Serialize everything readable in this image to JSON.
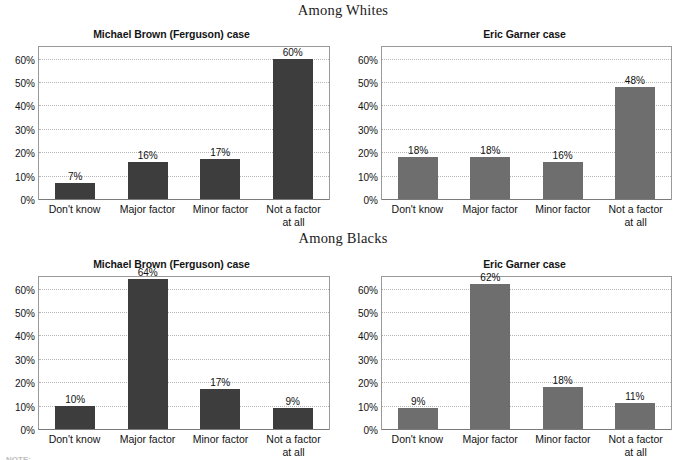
{
  "page": {
    "footnote": "NOTE:"
  },
  "groups": [
    {
      "id": "whites",
      "label": "Among Whites"
    },
    {
      "id": "blacks",
      "label": "Among Blacks"
    }
  ],
  "axis": {
    "ticks": [
      "60%",
      "50%",
      "40%",
      "30%",
      "20%",
      "10%",
      "0%"
    ],
    "categories": [
      "Don't know",
      "Major factor",
      "Minor factor",
      "Not a factor\nat all"
    ]
  },
  "chart_data": [
    {
      "type": "bar",
      "panel": "top-left",
      "group": "Among Whites",
      "title": "Michael Brown (Ferguson) case",
      "categories": [
        "Don't know",
        "Major factor",
        "Minor factor",
        "Not a factor at all"
      ],
      "values": [
        7,
        16,
        17,
        60
      ],
      "labels": [
        "7%",
        "16%",
        "17%",
        "60%"
      ],
      "xlabel": "",
      "ylabel": "",
      "ylim": [
        0,
        65
      ],
      "ytick_values": [
        0,
        10,
        20,
        30,
        40,
        50,
        60
      ],
      "ytick_labels": [
        "0%",
        "10%",
        "20%",
        "30%",
        "40%",
        "50%",
        "60%"
      ],
      "grid": true,
      "legend": "none",
      "bar_color": "#3d3d3d"
    },
    {
      "type": "bar",
      "panel": "top-right",
      "group": "Among Whites",
      "title": "Eric Garner case",
      "categories": [
        "Don't know",
        "Major factor",
        "Minor factor",
        "Not a factor at all"
      ],
      "values": [
        18,
        18,
        16,
        48
      ],
      "labels": [
        "18%",
        "18%",
        "16%",
        "48%"
      ],
      "xlabel": "",
      "ylabel": "",
      "ylim": [
        0,
        65
      ],
      "ytick_values": [
        0,
        10,
        20,
        30,
        40,
        50,
        60
      ],
      "ytick_labels": [
        "0%",
        "10%",
        "20%",
        "30%",
        "40%",
        "50%",
        "60%"
      ],
      "grid": true,
      "legend": "none",
      "bar_color": "#6e6e6e"
    },
    {
      "type": "bar",
      "panel": "bottom-left",
      "group": "Among Blacks",
      "title": "Michael Brown (Ferguson) case",
      "categories": [
        "Don't know",
        "Major factor",
        "Minor factor",
        "Not a factor at all"
      ],
      "values": [
        10,
        64,
        17,
        9
      ],
      "labels": [
        "10%",
        "64%",
        "17%",
        "9%"
      ],
      "xlabel": "",
      "ylabel": "",
      "ylim": [
        0,
        65
      ],
      "ytick_values": [
        0,
        10,
        20,
        30,
        40,
        50,
        60
      ],
      "ytick_labels": [
        "0%",
        "10%",
        "20%",
        "30%",
        "40%",
        "50%",
        "60%"
      ],
      "grid": true,
      "legend": "none",
      "bar_color": "#3d3d3d"
    },
    {
      "type": "bar",
      "panel": "bottom-right",
      "group": "Among Blacks",
      "title": "Eric Garner case",
      "categories": [
        "Don't know",
        "Major factor",
        "Minor factor",
        "Not a factor at all"
      ],
      "values": [
        9,
        62,
        18,
        11
      ],
      "labels": [
        "9%",
        "62%",
        "18%",
        "11%"
      ],
      "xlabel": "",
      "ylabel": "",
      "ylim": [
        0,
        65
      ],
      "ytick_values": [
        0,
        10,
        20,
        30,
        40,
        50,
        60
      ],
      "ytick_labels": [
        "0%",
        "10%",
        "20%",
        "30%",
        "40%",
        "50%",
        "60%"
      ],
      "grid": true,
      "legend": "none",
      "bar_color": "#6e6e6e"
    }
  ]
}
